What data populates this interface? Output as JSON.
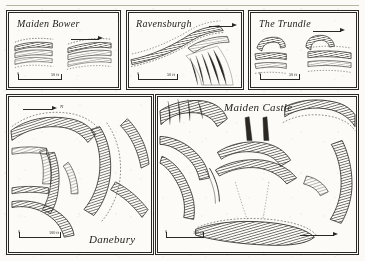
{
  "plate": {
    "background_color": "#fbfaf6",
    "ink_color": "#2b2722",
    "style": "pen-and-ink hachure survey plans"
  },
  "panels": [
    {
      "id": "maiden-bower",
      "title": "Maiden Bower",
      "scale": {
        "zero": "0",
        "label": "50 ft"
      },
      "north": {
        "label": "N"
      }
    },
    {
      "id": "ravensburgh",
      "title": "Ravensburgh",
      "scale": {
        "zero": "0",
        "label": "50 ft"
      },
      "north": {
        "label": "N"
      }
    },
    {
      "id": "the-trundle",
      "title": "The Trundle",
      "scale": {
        "zero": "0",
        "label": "50 ft"
      },
      "north": {
        "label": "N"
      }
    },
    {
      "id": "danebury",
      "title": "Danebury",
      "scale": {
        "zero": "0",
        "label": "100 ft"
      },
      "north": {
        "label": "N"
      }
    },
    {
      "id": "maiden-castle",
      "title": "Maiden Castle",
      "scale": {
        "zero": "0",
        "label": "100 ft"
      },
      "north": {
        "label": "N"
      }
    }
  ]
}
